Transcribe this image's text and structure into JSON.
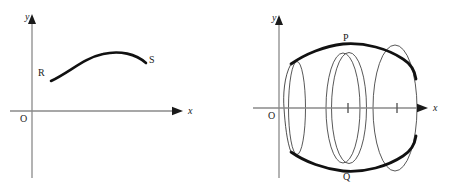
{
  "figure": {
    "background_color": "#ffffff",
    "stroke_color": "#111111",
    "axis_color": "#8a8a8a",
    "thin_stroke_color": "#3a3a3a"
  },
  "left_panel": {
    "name": "arc-RS-plot",
    "axes": {
      "x_label": "x",
      "y_label": "y",
      "origin_label": "O"
    },
    "curve": {
      "name": "arc-RS",
      "start_label": "R",
      "end_label": "S",
      "description": "concave-down arc from R up over a maximum and down to S"
    }
  },
  "right_panel": {
    "name": "solid-of-revolution-plot",
    "axes": {
      "x_label": "x",
      "y_label": "y",
      "origin_label": "O",
      "tick_count": 2
    },
    "solid": {
      "name": "solid-of-revolution",
      "top_label": "P",
      "bottom_label": "Q",
      "description": "arc RS revolved about the x-axis forming a barrel-like solid with cross-section ellipses"
    }
  }
}
